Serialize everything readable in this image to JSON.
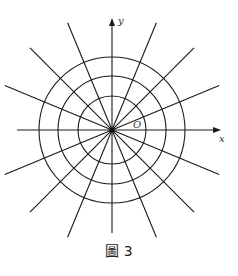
{
  "figure": {
    "center": {
      "x": 112,
      "y": 130
    },
    "circles": [
      34,
      54,
      73
    ],
    "ray_count": 16,
    "ray_length": 116,
    "axis": {
      "x": {
        "x1": 17,
        "x2": 221,
        "label": "x"
      },
      "y": {
        "y1": 18,
        "y2": 233,
        "label": "y"
      }
    },
    "origin_label": "O",
    "stroke_color": "#1a1a1a"
  },
  "caption": {
    "prefix": "圖",
    "number": "3"
  }
}
